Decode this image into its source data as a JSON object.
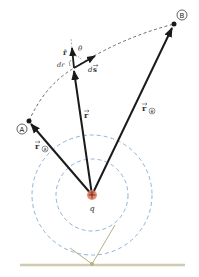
{
  "figure": {
    "charge": {
      "label": "q",
      "sign": "+",
      "color": "#e07a5f"
    },
    "points": {
      "A": {
        "label": "A"
      },
      "B": {
        "label": "B"
      }
    },
    "vectors": {
      "r_A": {
        "label": "r",
        "subscript": "A"
      },
      "r": {
        "label": "r"
      },
      "r_B": {
        "label": "r",
        "subscript": "B"
      },
      "r_hat": {
        "label": "r̂"
      },
      "ds": {
        "label_d": "d",
        "label_s": "s"
      }
    },
    "annotations": {
      "theta": "θ",
      "dr": "dr"
    },
    "colors": {
      "vector": "#1a1a1a",
      "equipotential": "#8fb3d9",
      "path": "#444444",
      "stand": "#b5b08a",
      "charge": "#e07a5f"
    }
  }
}
